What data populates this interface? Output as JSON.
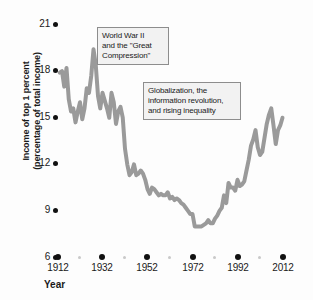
{
  "chart_data": {
    "type": "line",
    "title": "",
    "xlabel": "Year",
    "ylabel": "Income of top 1 percent (percentage of total income)",
    "ylabel_line1": "Income of top 1 percent",
    "ylabel_line2": "(percentage of total income)",
    "xlim": [
      1912,
      2014
    ],
    "ylim": [
      6,
      21
    ],
    "yticks": [
      6,
      9,
      12,
      15,
      18,
      21
    ],
    "xticks": [
      1912,
      1932,
      1952,
      1972,
      1992,
      2012
    ],
    "xminor": [
      1922,
      1942,
      1962,
      1982,
      2002
    ],
    "grid": false,
    "legend": null,
    "line_color": "#9a9a9a",
    "tick_color": "#111111",
    "annotations": [
      {
        "id": "ww2",
        "line1": "World War II",
        "line2": "and the \"Great",
        "line3": "Compression\"",
        "text": "World War II and the \"Great Compression\""
      },
      {
        "id": "globalization",
        "line1": "Globalization, the",
        "line2": "information revolution,",
        "line3": "and rising inequality",
        "text": "Globalization, the information revolution, and rising inequality"
      }
    ],
    "series": [
      {
        "name": "Income share of top 1 percent",
        "x": [
          1913,
          1914,
          1915,
          1916,
          1917,
          1918,
          1919,
          1920,
          1921,
          1922,
          1923,
          1924,
          1925,
          1926,
          1927,
          1928,
          1929,
          1930,
          1931,
          1932,
          1933,
          1934,
          1935,
          1936,
          1937,
          1938,
          1939,
          1940,
          1941,
          1942,
          1943,
          1944,
          1945,
          1946,
          1947,
          1948,
          1949,
          1950,
          1951,
          1952,
          1953,
          1954,
          1955,
          1956,
          1957,
          1958,
          1959,
          1960,
          1961,
          1962,
          1963,
          1964,
          1965,
          1966,
          1967,
          1968,
          1969,
          1970,
          1971,
          1972,
          1973,
          1974,
          1975,
          1976,
          1977,
          1978,
          1979,
          1980,
          1981,
          1982,
          1983,
          1984,
          1985,
          1986,
          1987,
          1988,
          1989,
          1990,
          1991,
          1992,
          1993,
          1994,
          1995,
          1996,
          1997,
          1998,
          1999,
          2000,
          2001,
          2002,
          2003,
          2004,
          2005,
          2006,
          2007,
          2008,
          2009,
          2010,
          2011,
          2012
        ],
        "values": [
          17.9,
          18.0,
          17.0,
          18.2,
          16.2,
          15.4,
          15.6,
          14.7,
          15.4,
          16.0,
          14.9,
          15.6,
          16.9,
          16.6,
          17.7,
          19.4,
          18.4,
          16.4,
          15.6,
          16.6,
          16.1,
          15.6,
          15.0,
          16.6,
          16.0,
          14.6,
          15.4,
          15.7,
          15.0,
          13.0,
          12.0,
          11.3,
          11.5,
          12.0,
          11.3,
          11.4,
          11.6,
          11.4,
          11.0,
          10.4,
          10.1,
          10.5,
          10.4,
          10.2,
          10.0,
          10.1,
          10.0,
          10.0,
          10.2,
          9.8,
          9.9,
          9.7,
          9.8,
          9.7,
          9.5,
          9.4,
          9.2,
          9.0,
          8.8,
          8.8,
          8.0,
          8.0,
          8.0,
          8.0,
          8.1,
          8.2,
          8.4,
          8.2,
          8.2,
          8.5,
          8.7,
          9.0,
          9.2,
          10.0,
          9.5,
          10.8,
          10.5,
          10.5,
          10.3,
          11.0,
          10.6,
          10.7,
          10.9,
          11.6,
          12.3,
          13.2,
          13.6,
          14.2,
          13.1,
          12.6,
          12.8,
          13.7,
          14.6,
          15.2,
          15.6,
          14.5,
          13.3,
          14.2,
          14.5,
          15.0
        ]
      }
    ],
    "smooth_path_note": "thick grey freehand-style line"
  },
  "axis": {
    "y_tick_labels": [
      "21",
      "18",
      "15",
      "12",
      "9",
      "6"
    ],
    "x_tick_labels": [
      "1912",
      "1932",
      "1952",
      "1972",
      "1992",
      "2012"
    ],
    "x_axis_title": "Year"
  }
}
